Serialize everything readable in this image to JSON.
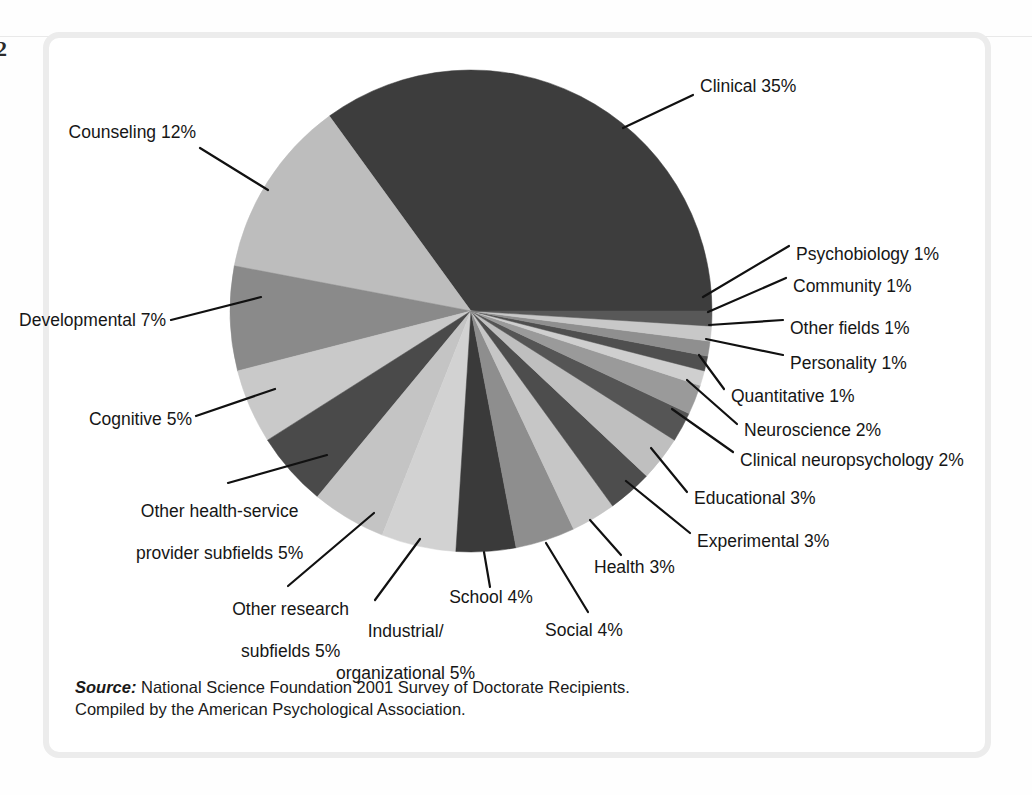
{
  "page": {
    "folio": "2"
  },
  "source": {
    "label": "Source:",
    "line1": " National Science Foundation 2001 Survey of Doctorate Recipients.",
    "line2": "Compiled by the American Psychological Association."
  },
  "chart_data": {
    "type": "pie",
    "title": "",
    "subtitle": "",
    "xlabel": "",
    "ylabel": "",
    "legend_position": "callout-labels",
    "grid": false,
    "units": "percent",
    "total": 100,
    "start_angle_deg": 0,
    "direction": "counterclockwise",
    "categories": [
      "Clinical",
      "Counseling",
      "Developmental",
      "Cognitive",
      "Other health-service provider subfields",
      "Other research subfields",
      "Industrial/organizational",
      "School",
      "Social",
      "Health",
      "Experimental",
      "Educational",
      "Clinical neuropsychology",
      "Neuroscience",
      "Quantitative",
      "Personality",
      "Other fields",
      "Community",
      "Psychobiology"
    ],
    "values": [
      35,
      12,
      7,
      5,
      5,
      5,
      5,
      4,
      4,
      3,
      3,
      3,
      2,
      2,
      1,
      1,
      1,
      1,
      1
    ],
    "colors": [
      "#3d3d3d",
      "#bdbdbd",
      "#8a8a8a",
      "#c9c9c9",
      "#4a4a4a",
      "#c4c4c4",
      "#d2d2d2",
      "#3a3a3a",
      "#8e8e8e",
      "#c6c6c6",
      "#4d4d4d",
      "#bfbfbf",
      "#555555",
      "#9a9a9a",
      "#cfcfcf",
      "#4f4f4f",
      "#8f8f8f",
      "#c8c8c8",
      "#585858"
    ],
    "slice_labels": [
      "Clinical 35%",
      "Counseling 12%",
      "Developmental 7%",
      "Cognitive 5%",
      "Other health-service\nprovider subfields 5%",
      "Other research\nsubfields 5%",
      "Industrial/\norganizational 5%",
      "School 4%",
      "Social 4%",
      "Health 3%",
      "Experimental 3%",
      "Educational 3%",
      "Clinical neuropsychology 2%",
      "Neuroscience 2%",
      "Quantitative 1%",
      "Personality 1%",
      "Other fields 1%",
      "Community 1%",
      "Psychobiology 1%"
    ]
  },
  "labels": {
    "clinical": "Clinical 35%",
    "counseling": "Counseling 12%",
    "developmental": "Developmental 7%",
    "cognitive": "Cognitive 5%",
    "other_health_line1": "Other health-service",
    "other_health_line2": "provider subfields 5%",
    "other_research_line1": "Other research",
    "other_research_line2": "subfields 5%",
    "industrial_line1": "Industrial/",
    "industrial_line2": "organizational 5%",
    "school": "School 4%",
    "social": "Social 4%",
    "health": "Health 3%",
    "experimental": "Experimental 3%",
    "educational": "Educational 3%",
    "clinical_neuro": "Clinical neuropsychology 2%",
    "neuroscience": "Neuroscience 2%",
    "quantitative": "Quantitative 1%",
    "personality": "Personality 1%",
    "other_fields": "Other fields 1%",
    "community": "Community 1%",
    "psychobiology": "Psychobiology 1%"
  },
  "geometry": {
    "center_x": 471,
    "center_y": 311,
    "radius": 241
  }
}
